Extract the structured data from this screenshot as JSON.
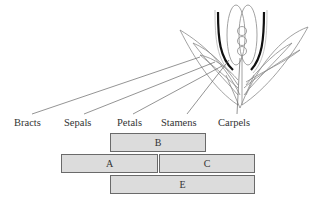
{
  "diagram": {
    "organ_labels": [
      {
        "key": "bracts",
        "text": "Bracts"
      },
      {
        "key": "sepals",
        "text": "Sepals"
      },
      {
        "key": "petals",
        "text": "Petals"
      },
      {
        "key": "stamens",
        "text": "Stamens"
      },
      {
        "key": "carpels",
        "text": "Carpels"
      }
    ],
    "gene_classes": [
      {
        "key": "B",
        "text": "B",
        "spans": [
          "Petals",
          "Stamens"
        ]
      },
      {
        "key": "A",
        "text": "A",
        "spans": [
          "Sepals",
          "Petals"
        ]
      },
      {
        "key": "C",
        "text": "C",
        "spans": [
          "Stamens",
          "Carpels"
        ]
      },
      {
        "key": "E",
        "text": "E",
        "spans": [
          "Petals",
          "Stamens",
          "Carpels"
        ]
      }
    ],
    "colors": {
      "box_fill": "#dcdcdc",
      "box_border": "#6a6a6a",
      "line": "#777777",
      "stamen_dark": "#111111"
    }
  }
}
